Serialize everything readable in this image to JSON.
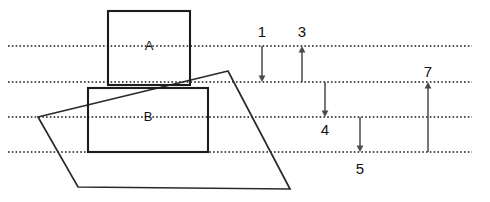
{
  "diagram": {
    "background_color": "#ffffff",
    "line_color": "#1c1c1c",
    "arrow_color": "#4a4a4a",
    "reference_lines": [
      {
        "name": "line-1",
        "y": 46,
        "x_start": 8,
        "x_end": 472
      },
      {
        "name": "line-2",
        "y": 82,
        "x_start": 8,
        "x_end": 472
      },
      {
        "name": "line-3",
        "y": 117,
        "x_start": 8,
        "x_end": 472
      },
      {
        "name": "line-4",
        "y": 152,
        "x_start": 8,
        "x_end": 472
      }
    ],
    "blocks": [
      {
        "label": "A",
        "x": 108,
        "y": 11,
        "width": 82,
        "height": 74,
        "label_x": 149,
        "label_y": 47
      },
      {
        "label": "B",
        "x": 88,
        "y": 88,
        "width": 120,
        "height": 64,
        "label_x": 148,
        "label_y": 118
      }
    ],
    "parallelogram": {
      "name": "shear-parallelogram",
      "points": "228,71 38,117 78,187 290,189"
    },
    "dimension_arrows": [
      {
        "label": "1",
        "x": 262,
        "y_top": 46,
        "y_bottom": 82,
        "direction": "down",
        "label_x": 262,
        "label_y": 33
      },
      {
        "label": "3",
        "x": 302,
        "y_top": 46,
        "y_bottom": 82,
        "direction": "up",
        "label_x": 302,
        "label_y": 33
      },
      {
        "label": "4",
        "x": 325,
        "y_top": 82,
        "y_bottom": 117,
        "direction": "down",
        "label_x": 325,
        "label_y": 131
      },
      {
        "label": "5",
        "x": 360,
        "y_top": 117,
        "y_bottom": 152,
        "direction": "down",
        "label_x": 360,
        "label_y": 170
      },
      {
        "label": "7",
        "x": 428,
        "y_top": 82,
        "y_bottom": 152,
        "direction": "up",
        "label_x": 428,
        "label_y": 73
      }
    ]
  }
}
